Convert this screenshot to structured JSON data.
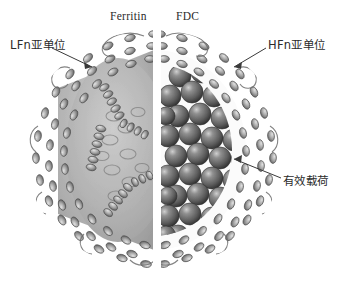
{
  "figure": {
    "title_top_left": "Ferritin",
    "title_top_right": "FDC",
    "caption_alt": "Ferritin nanocage cutaway: empty LFn cage on the left, HFn cage loaded with spherical payload on the right"
  },
  "labels": {
    "ferritin": "Ferritin",
    "fdc": "FDC",
    "lfn_subunit": "LFn亚单位",
    "hfn_subunit": "HFn亚单位",
    "payload": "有效载荷"
  },
  "colors": {
    "background": "#ffffff",
    "text": "#2b2b2b",
    "leader_line": "#3a3a3a",
    "shell_outline": "#5f5f5f",
    "shell_helix_light": "#d2d2d2",
    "shell_helix_mid": "#9a9a9a",
    "shell_helix_dark": "#555555",
    "cavity_gray": "#b6b6b6",
    "payload_sphere": "#6a6a6a",
    "payload_sphere_highlight": "#c8c8c8",
    "payload_sphere_shadow": "#3b3b3b"
  },
  "structure": {
    "left_half": {
      "name": "LFn cage (hollow)",
      "filled": false,
      "representation": "cartoon helices"
    },
    "right_half": {
      "name": "HFn cage (loaded)",
      "filled": true,
      "representation": "cartoon helices with spherical payload core",
      "payload_sphere_count": 46
    },
    "split_axis": "vertical",
    "split_x": 157
  },
  "leaders": [
    {
      "name": "lfn-leader",
      "from": [
        52,
        48
      ],
      "to": [
        90,
        66
      ]
    },
    {
      "name": "hfn-leader",
      "from": [
        266,
        48
      ],
      "to": [
        236,
        66
      ]
    },
    {
      "name": "payload-leader",
      "from": [
        281,
        178
      ],
      "to": [
        236,
        160
      ]
    }
  ]
}
